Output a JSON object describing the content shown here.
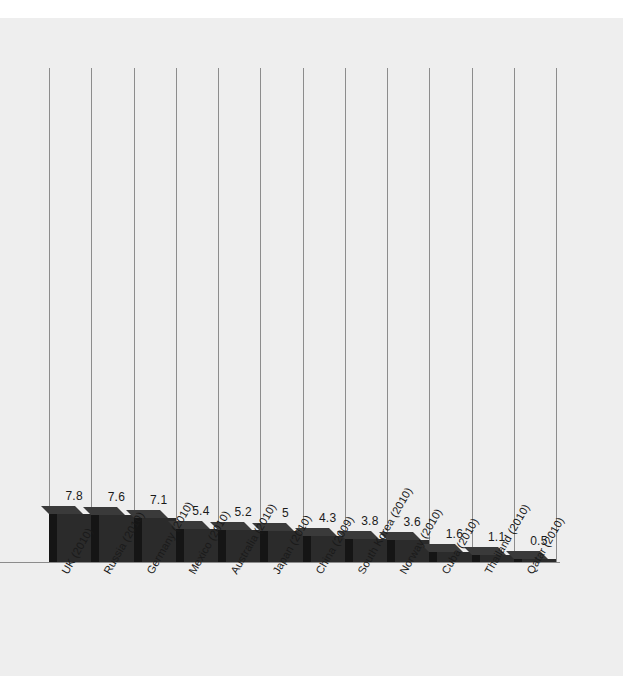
{
  "chart_data": {
    "type": "bar",
    "title": "",
    "subtitle": "",
    "xlabel": "",
    "ylabel": "",
    "grid": "vertical",
    "legend": "none",
    "ylim": [
      0,
      7.8
    ],
    "categories": [
      "UK (2010)",
      "Russia (2010)",
      "Germany (2010)",
      "Mexico (2010)",
      "Australia (2010)",
      "Japan (2010)",
      "China (2009)",
      "South Korea (2010)",
      "Norway (2010)",
      "Cuba (2010)",
      "Thailand (2010)",
      "Qatar (2010)"
    ],
    "values": [
      7.8,
      7.6,
      7.1,
      5.4,
      5.2,
      5,
      4.3,
      3.8,
      3.6,
      1.6,
      1.1,
      0.5
    ],
    "value_labels": [
      "7.8",
      "7.6",
      "7.1",
      "5.4",
      "5.2",
      "5",
      "4.3",
      "3.8",
      "3.6",
      "1.6",
      "1.1",
      "0.5"
    ],
    "bar_style": "3d-extruded",
    "colors": {
      "background": "#eeeeee",
      "page": "#ffffff",
      "bar_front": "#2b2b2b",
      "bar_side": "#151515",
      "bar_top": "#3a3a3a",
      "gridline": "#8c8c8c",
      "axis": "#8c8c8c",
      "text": "#1a1a1a"
    }
  }
}
